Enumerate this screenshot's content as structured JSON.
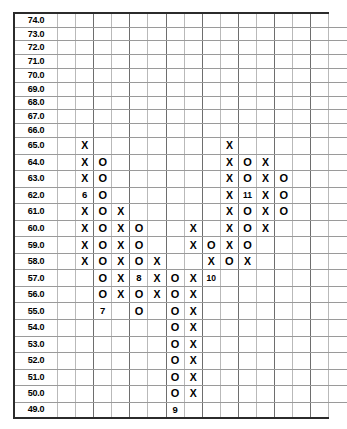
{
  "chart_data": {
    "type": "table",
    "title": "",
    "subtitle": "",
    "xlabel": "",
    "ylabel": "",
    "grid": true,
    "legend": "none",
    "columns_count": 16,
    "row_labels": [
      "74.0",
      "73.0",
      "72.0",
      "71.0",
      "70.0",
      "69.0",
      "68.0",
      "67.0",
      "66.0",
      "65.0",
      "64.0",
      "63.0",
      "62.0",
      "61.0",
      "60.0",
      "59.0",
      "58.0",
      "57.0",
      "56.0",
      "55.0",
      "54.0",
      "53.0",
      "52.0",
      "51.0",
      "50.0",
      "49.0"
    ],
    "ylim": [
      49.0,
      74.0
    ],
    "bold_labels": [
      "70.0",
      "69.0",
      "68.0",
      "67.0",
      "66.0",
      "65.0",
      "64.0",
      "63.0",
      "62.0",
      "61.0",
      "60.0",
      "59.0",
      "58.0",
      "57.0",
      "56.0",
      "55.0",
      "54.0",
      "53.0",
      "52.0",
      "51.0",
      "50.0",
      "49.0"
    ],
    "rows": [
      {
        "label": "74.0",
        "cells": [
          "",
          "",
          "",
          "",
          "",
          "",
          "",
          "",
          "",
          "",
          "",
          "",
          "",
          "",
          "",
          ""
        ]
      },
      {
        "label": "73.0",
        "cells": [
          "",
          "",
          "",
          "",
          "",
          "",
          "",
          "",
          "",
          "",
          "",
          "",
          "",
          "",
          "",
          ""
        ]
      },
      {
        "label": "72.0",
        "cells": [
          "",
          "",
          "",
          "",
          "",
          "",
          "",
          "",
          "",
          "",
          "",
          "",
          "",
          "",
          "",
          ""
        ]
      },
      {
        "label": "71.0",
        "cells": [
          "",
          "",
          "",
          "",
          "",
          "",
          "",
          "",
          "",
          "",
          "",
          "",
          "",
          "",
          "",
          ""
        ]
      },
      {
        "label": "70.0",
        "cells": [
          "",
          "",
          "",
          "",
          "",
          "",
          "",
          "",
          "",
          "",
          "",
          "",
          "",
          "",
          "",
          ""
        ]
      },
      {
        "label": "69.0",
        "cells": [
          "",
          "",
          "",
          "",
          "",
          "",
          "",
          "",
          "",
          "",
          "",
          "",
          "",
          "",
          "",
          ""
        ]
      },
      {
        "label": "68.0",
        "cells": [
          "",
          "",
          "",
          "",
          "",
          "",
          "",
          "",
          "",
          "",
          "",
          "",
          "",
          "",
          "",
          ""
        ]
      },
      {
        "label": "67.0",
        "cells": [
          "",
          "",
          "",
          "",
          "",
          "",
          "",
          "",
          "",
          "",
          "",
          "",
          "",
          "",
          "",
          ""
        ]
      },
      {
        "label": "66.0",
        "cells": [
          "",
          "",
          "",
          "",
          "",
          "",
          "",
          "",
          "",
          "",
          "",
          "",
          "",
          "",
          "",
          ""
        ]
      },
      {
        "label": "65.0",
        "cells": [
          "",
          "X",
          "",
          "",
          "",
          "",
          "",
          "",
          "",
          "X",
          "",
          "",
          "",
          "",
          "",
          ""
        ]
      },
      {
        "label": "64.0",
        "cells": [
          "",
          "X",
          "O",
          "",
          "",
          "",
          "",
          "",
          "",
          "X",
          "O",
          "X",
          "",
          "",
          "",
          ""
        ]
      },
      {
        "label": "63.0",
        "cells": [
          "",
          "X",
          "O",
          "",
          "",
          "",
          "",
          "",
          "",
          "X",
          "O",
          "X",
          "O",
          "",
          "",
          ""
        ]
      },
      {
        "label": "62.0",
        "cells": [
          "",
          "6",
          "O",
          "",
          "",
          "",
          "",
          "",
          "",
          "X",
          "11",
          "X",
          "O",
          "",
          "",
          ""
        ]
      },
      {
        "label": "61.0",
        "cells": [
          "",
          "X",
          "O",
          "X",
          "",
          "",
          "",
          "",
          "",
          "X",
          "O",
          "X",
          "O",
          "",
          "",
          ""
        ]
      },
      {
        "label": "60.0",
        "cells": [
          "",
          "X",
          "O",
          "X",
          "O",
          "",
          "",
          "X",
          "",
          "X",
          "O",
          "X",
          "",
          "",
          "",
          ""
        ]
      },
      {
        "label": "59.0",
        "cells": [
          "",
          "X",
          "O",
          "X",
          "O",
          "",
          "",
          "X",
          "O",
          "X",
          "O",
          "",
          "",
          "",
          "",
          ""
        ]
      },
      {
        "label": "58.0",
        "cells": [
          "",
          "X",
          "O",
          "X",
          "O",
          "X",
          "",
          "",
          "X",
          "O",
          "X",
          "",
          "",
          "",
          "",
          ""
        ]
      },
      {
        "label": "57.0",
        "cells": [
          "",
          "",
          "O",
          "X",
          "8",
          "X",
          "O",
          "X",
          "10",
          "",
          "",
          "",
          "",
          "",
          "",
          ""
        ]
      },
      {
        "label": "56.0",
        "cells": [
          "",
          "",
          "O",
          "X",
          "O",
          "X",
          "O",
          "X",
          "",
          "",
          "",
          "",
          "",
          "",
          "",
          ""
        ]
      },
      {
        "label": "55.0",
        "cells": [
          "",
          "",
          "7",
          "",
          "O",
          "",
          "O",
          "X",
          "",
          "",
          "",
          "",
          "",
          "",
          "",
          ""
        ]
      },
      {
        "label": "54.0",
        "cells": [
          "",
          "",
          "",
          "",
          "",
          "",
          "O",
          "X",
          "",
          "",
          "",
          "",
          "",
          "",
          "",
          ""
        ]
      },
      {
        "label": "53.0",
        "cells": [
          "",
          "",
          "",
          "",
          "",
          "",
          "O",
          "X",
          "",
          "",
          "",
          "",
          "",
          "",
          "",
          ""
        ]
      },
      {
        "label": "52.0",
        "cells": [
          "",
          "",
          "",
          "",
          "",
          "",
          "O",
          "X",
          "",
          "",
          "",
          "",
          "",
          "",
          "",
          ""
        ]
      },
      {
        "label": "51.0",
        "cells": [
          "",
          "",
          "",
          "",
          "",
          "",
          "O",
          "X",
          "",
          "",
          "",
          "",
          "",
          "",
          "",
          ""
        ]
      },
      {
        "label": "50.0",
        "cells": [
          "",
          "",
          "",
          "",
          "",
          "",
          "O",
          "X",
          "",
          "",
          "",
          "",
          "",
          "",
          "",
          ""
        ]
      },
      {
        "label": "49.0",
        "cells": [
          "",
          "",
          "",
          "",
          "",
          "",
          "9",
          "",
          "",
          "",
          "",
          "",
          "",
          "",
          "",
          ""
        ]
      }
    ],
    "marker_legend": {
      "X": "rising column mark",
      "O": "falling column mark",
      "6": "month 6 start",
      "7": "month 7 start",
      "8": "month 8 start",
      "9": "month 9 start",
      "10": "month 10 start",
      "11": "month 11 start"
    },
    "colors": {
      "border": "#2b2b2b",
      "gridline": "#b9b9b9",
      "gridline_major": "#6e6e6e",
      "text": "#000000",
      "background": "#ffffff"
    }
  }
}
